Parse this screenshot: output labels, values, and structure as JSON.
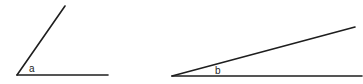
{
  "diagram": {
    "type": "angle-comparison",
    "angles": [
      {
        "id": "a",
        "label": "a",
        "description": "acute angle, roughly 55 degrees"
      },
      {
        "id": "b",
        "label": "b",
        "description": "acute angle, roughly 15 degrees"
      }
    ],
    "stroke_color": "#1e1e1e",
    "background": "#ffffff"
  }
}
